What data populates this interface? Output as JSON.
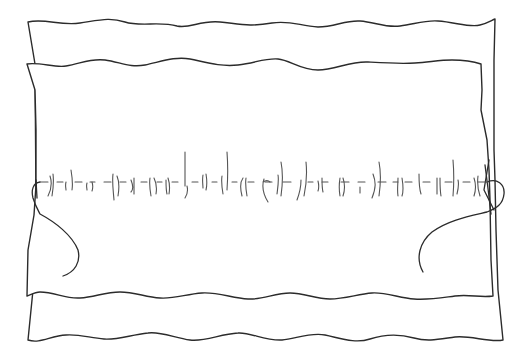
{
  "illustration": {
    "subject": "two layers of fabric joined by a hand-sewn running stitch",
    "colors": {
      "background": "#ffffff",
      "ink": "#2b2b2b",
      "stitch": "#555555"
    },
    "elements": {
      "back_fabric": "back-fabric-layer",
      "front_fabric": "front-fabric-layer",
      "stitch_line": "running-stitch",
      "left_thread": "left-thread-tail",
      "right_thread": "right-thread-tail"
    },
    "stitch_count": 24
  }
}
